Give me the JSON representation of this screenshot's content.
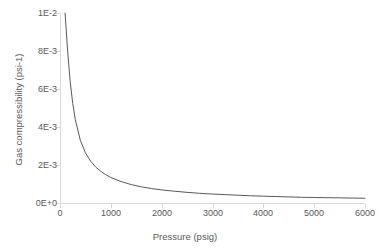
{
  "chart_data": {
    "type": "line",
    "title": "",
    "xlabel": "Pressure (psig)",
    "ylabel": "Gas compressibility (psi-1)",
    "xlim": [
      0,
      6000
    ],
    "ylim": [
      0,
      0.01
    ],
    "xticks": [
      "0",
      "1000",
      "2000",
      "3000",
      "4000",
      "5000",
      "6000"
    ],
    "xtick_values": [
      0,
      1000,
      2000,
      3000,
      4000,
      5000,
      6000
    ],
    "yticks": [
      "0E+0",
      "2E-3",
      "4E-3",
      "6E-3",
      "8E-3",
      "1E-2"
    ],
    "ytick_values": [
      0,
      0.002,
      0.004,
      0.006,
      0.008,
      0.01
    ],
    "grid": false,
    "legend": false,
    "line_color": "#595959",
    "axis_color": "#d9d9d9",
    "text_color": "#595959",
    "series": [
      {
        "name": "Gas compressibility",
        "x": [
          100,
          150,
          200,
          250,
          300,
          400,
          500,
          600,
          700,
          800,
          900,
          1000,
          1200,
          1400,
          1600,
          1800,
          2000,
          2250,
          2500,
          2750,
          3000,
          3250,
          3500,
          3750,
          4000,
          4250,
          4500,
          4750,
          5000,
          5250,
          5500,
          5750,
          6000
        ],
        "y": [
          0.01,
          0.008,
          0.0064,
          0.00525,
          0.0044,
          0.0033,
          0.00264,
          0.00221,
          0.0019,
          0.00167,
          0.00149,
          0.00134,
          0.00113,
          0.00097,
          0.00085,
          0.00076,
          0.00069,
          0.00062,
          0.00056,
          0.00051,
          0.00047,
          0.00044,
          0.00041,
          0.00038,
          0.00036,
          0.00034,
          0.00032,
          0.0003,
          0.00029,
          0.00028,
          0.00027,
          0.00026,
          0.00025
        ]
      }
    ]
  },
  "axes": {
    "x_title": "Pressure (psig)",
    "y_title": "Gas compressibility (psi-1)",
    "x_tick_labels": [
      "0",
      "1000",
      "2000",
      "3000",
      "4000",
      "5000",
      "6000"
    ],
    "y_tick_labels": [
      "1E-2",
      "8E-3",
      "6E-3",
      "4E-3",
      "2E-3",
      "0E+0"
    ]
  }
}
